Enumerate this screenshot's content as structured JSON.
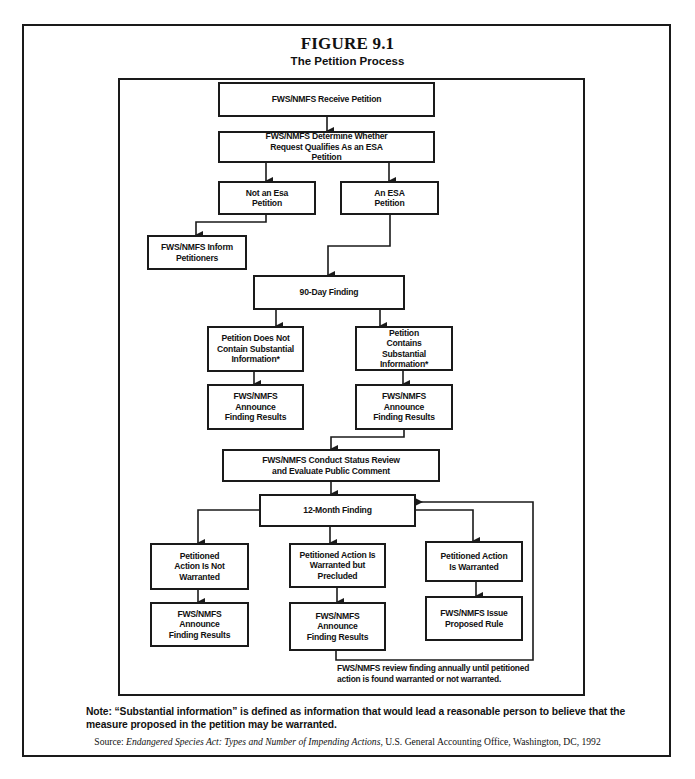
{
  "figure": {
    "title": "FIGURE 9.1",
    "subtitle": "The Petition Process"
  },
  "nodes": {
    "receive": "FWS/NMFS Receive Petition",
    "determine": "FWS/NMFS Determine Whether Request Qualifies As an ESA Petition",
    "not_esa": "Not an Esa Petition",
    "esa": "An ESA Petition",
    "inform": "FWS/NMFS Inform Petitioners",
    "finding90": "90-Day Finding",
    "not_substantial": "Petition Does Not Contain Substantial Information*",
    "substantial": "Petition Contains Substantial Information*",
    "announce1": "FWS/NMFS Announce Finding Results",
    "announce2": "FWS/NMFS Announce Finding Results",
    "status_review": "FWS/NMFS Conduct Status Review and Evaluate Public Comment",
    "finding12": "12-Month Finding",
    "not_warranted": "Petitioned Action Is Not Warranted",
    "precluded": "Petitioned Action Is Warranted but Precluded",
    "warranted": "Petitioned Action Is Warranted",
    "announce3": "FWS/NMFS Announce Finding Results",
    "announce4": "FWS/NMFS Announce Finding Results",
    "proposed_rule": "FWS/NMFS Issue Proposed Rule"
  },
  "edges": [
    [
      "receive",
      "determine"
    ],
    [
      "determine",
      "not_esa"
    ],
    [
      "determine",
      "esa"
    ],
    [
      "not_esa",
      "inform"
    ],
    [
      "esa",
      "finding90"
    ],
    [
      "finding90",
      "not_substantial"
    ],
    [
      "finding90",
      "substantial"
    ],
    [
      "not_substantial",
      "announce1"
    ],
    [
      "substantial",
      "announce2"
    ],
    [
      "announce2",
      "status_review"
    ],
    [
      "status_review",
      "finding12"
    ],
    [
      "finding12",
      "not_warranted"
    ],
    [
      "finding12",
      "precluded"
    ],
    [
      "finding12",
      "warranted"
    ],
    [
      "not_warranted",
      "announce3"
    ],
    [
      "precluded",
      "announce4"
    ],
    [
      "warranted",
      "proposed_rule"
    ],
    [
      "announce4",
      "finding12"
    ]
  ],
  "loop_note": "FWS/NMFS review finding annually until petitioned action is found warranted or not warranted.",
  "note": "Note: “Substantial information” is defined as information that would lead a reasonable person to believe that the measure proposed in the petition may be warranted.",
  "source": {
    "label": "Source: ",
    "title": "Endangered Species Act: Types and Number of Impending Actions",
    "rest": ", U.S. General Accounting Office, Washington, DC, 1992"
  }
}
